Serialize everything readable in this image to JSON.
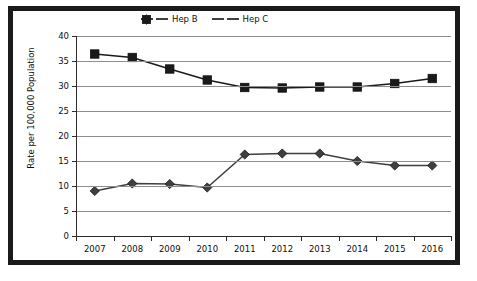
{
  "chart_data": {
    "type": "line",
    "title": "",
    "xlabel": "",
    "ylabel": "Rate per 100,000 Population",
    "categories": [
      "2007",
      "2008",
      "2009",
      "2010",
      "2011",
      "2012",
      "2013",
      "2014",
      "2015",
      "2016"
    ],
    "ylim": [
      0,
      40
    ],
    "ytick_step": 5,
    "ytick_labels": [
      "40",
      "35",
      "30",
      "25",
      "20",
      "15",
      "10",
      "5",
      "0"
    ],
    "grid": "horizontal",
    "legend_position": "top-center-inside",
    "series": [
      {
        "name": "Hep B",
        "marker": "diamond",
        "color": "#3f3f3f",
        "values": [
          9.0,
          10.5,
          10.4,
          9.7,
          16.3,
          16.5,
          16.5,
          15.0,
          14.1,
          14.1
        ]
      },
      {
        "name": "Hep C",
        "marker": "square",
        "color": "#1a1a1a",
        "values": [
          36.4,
          35.7,
          33.4,
          31.2,
          29.7,
          29.6,
          29.8,
          29.8,
          30.5,
          31.5
        ]
      }
    ]
  },
  "legend": {
    "items": [
      {
        "label": "Hep B"
      },
      {
        "label": "Hep C"
      }
    ]
  },
  "colors": {
    "border": "#1a1a1a",
    "grid": "#8d8d8d",
    "axis": "#2b2b2b",
    "hep_b": "#3f3f3f",
    "hep_c": "#1a1a1a",
    "background": "#ffffff"
  }
}
